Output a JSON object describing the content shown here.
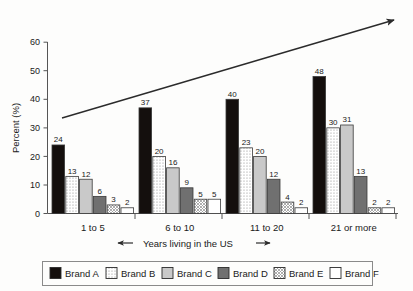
{
  "chart_data": {
    "type": "bar",
    "title": "",
    "subtitle": "",
    "xlabel": "Years living in the US",
    "xlabel_prefix_icon": "left-arrow-icon",
    "xlabel_suffix_icon": "right-arrow-icon",
    "ylabel": "Percent (%)",
    "ylim": [
      0,
      60
    ],
    "ytick_step": 10,
    "yticks": [
      "0",
      "10",
      "20",
      "30",
      "40",
      "50",
      "60"
    ],
    "grid": false,
    "legend_position": "bottom",
    "categories": [
      "1 to 5",
      "6 to 10",
      "11 to 20",
      "21 or more"
    ],
    "series": [
      {
        "name": "Brand A",
        "values": [
          24,
          37,
          40,
          48
        ],
        "fill": "#140f0d",
        "pattern": "solid-black"
      },
      {
        "name": "Brand B",
        "values": [
          13,
          20,
          23,
          30
        ],
        "fill": "#ffffff",
        "pattern": "dotted"
      },
      {
        "name": "Brand C",
        "values": [
          12,
          16,
          20,
          31
        ],
        "fill": "#c9c9c9",
        "pattern": "solid-light-gray"
      },
      {
        "name": "Brand D",
        "values": [
          6,
          9,
          12,
          13
        ],
        "fill": "#707070",
        "pattern": "solid-dark-gray"
      },
      {
        "name": "Brand E",
        "values": [
          3,
          5,
          4,
          2
        ],
        "fill": "#ffffff",
        "pattern": "crosshatch"
      },
      {
        "name": "Brand F",
        "values": [
          2,
          5,
          2,
          2
        ],
        "fill": "#ffffff",
        "pattern": "solid-white"
      }
    ],
    "annotations": [
      {
        "name": "upward-trend-arrow",
        "type": "arrow",
        "from": [
          62,
          118
        ],
        "to": [
          396,
          19
        ]
      }
    ]
  },
  "legend": {
    "items": [
      {
        "label": "Brand A"
      },
      {
        "label": "Brand B"
      },
      {
        "label": "Brand C"
      },
      {
        "label": "Brand D"
      },
      {
        "label": "Brand E"
      },
      {
        "label": "Brand F"
      }
    ]
  }
}
